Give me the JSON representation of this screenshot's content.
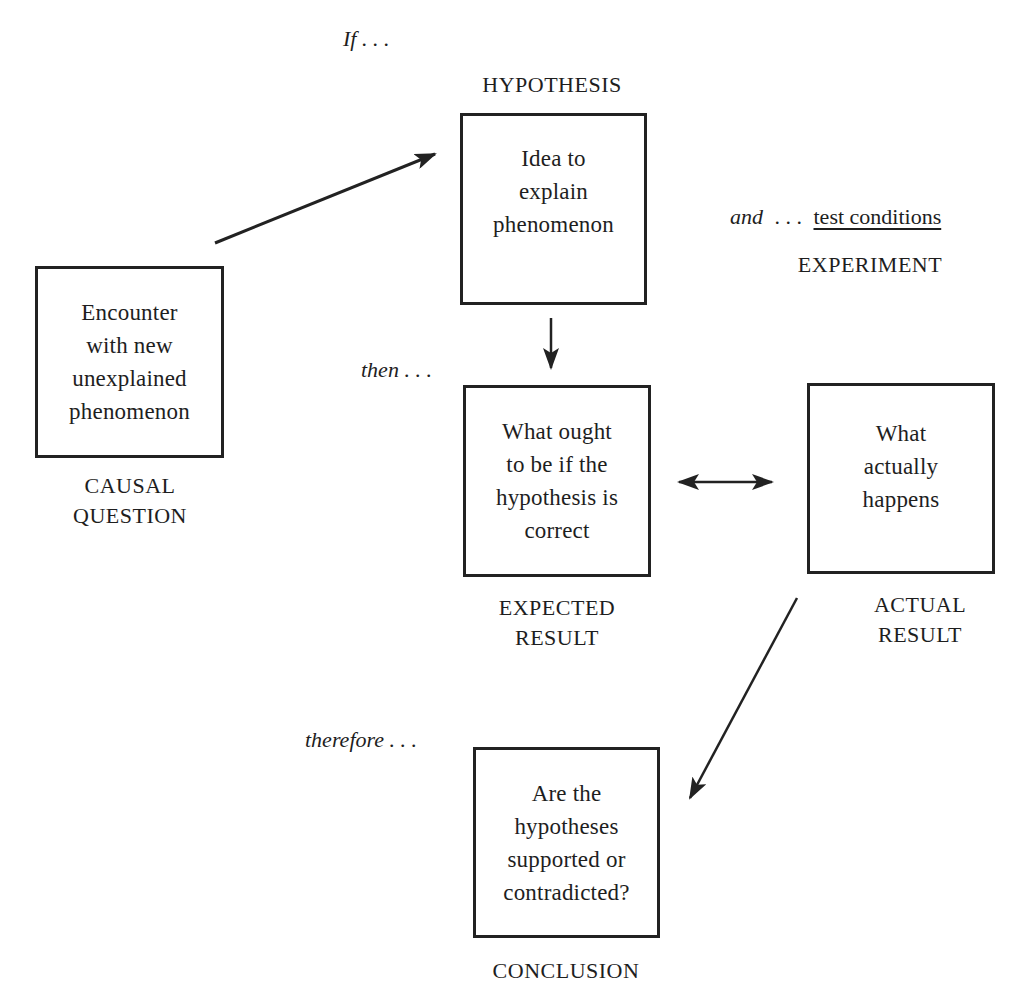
{
  "top_cut_text": ") . . . . . .  . . Hyp",
  "connectors": {
    "if": "If . . .",
    "and": "and",
    "and_dots": ". . .",
    "test_conditions": "test conditions",
    "then": "then . . .",
    "therefore": "therefore . . ."
  },
  "nodes": {
    "hypothesis": {
      "label": "HYPOTHESIS",
      "text": "Idea to\nexplain\nphenomenon"
    },
    "causal_question": {
      "label": "CAUSAL\nQUESTION",
      "text": "Encounter\nwith new\nunexplained\nphenomenon"
    },
    "experiment": {
      "label": "EXPERIMENT"
    },
    "expected_result": {
      "label": "EXPECTED\nRESULT",
      "text": "What ought\nto be if the\nhypothesis is\ncorrect"
    },
    "actual_result": {
      "label": "ACTUAL\nRESULT",
      "text": "What\nactually\nhappens"
    },
    "conclusion": {
      "label": "CONCLUSION",
      "text": "Are the\nhypotheses\nsupported or\ncontradicted?"
    }
  },
  "edges": [
    {
      "from": "causal_question",
      "to": "hypothesis",
      "type": "single"
    },
    {
      "from": "hypothesis",
      "to": "expected_result",
      "type": "single"
    },
    {
      "from": "expected_result",
      "to": "actual_result",
      "type": "double"
    },
    {
      "from": "actual_result",
      "to": "conclusion",
      "type": "single"
    }
  ],
  "colors": {
    "stroke": "#222222",
    "text": "#1e1e1e",
    "background": "#ffffff"
  }
}
